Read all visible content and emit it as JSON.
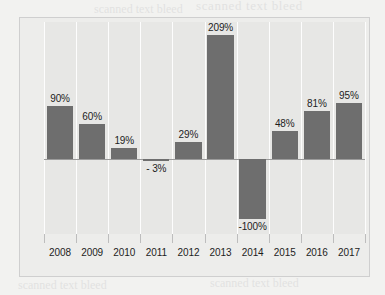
{
  "chart_data": {
    "type": "bar",
    "title": "",
    "xlabel": "",
    "ylabel": "Return on Investment",
    "categories": [
      "2008",
      "2009",
      "2010",
      "2011",
      "2012",
      "2013",
      "2014",
      "2015",
      "2016",
      "2017"
    ],
    "values": [
      90,
      60,
      19,
      -3,
      29,
      209,
      -100,
      48,
      81,
      95
    ],
    "data_labels": [
      "90%",
      "60%",
      "19%",
      "- 3%",
      "29%",
      "209%",
      "-100%",
      "48%",
      "81%",
      "95%"
    ],
    "unit": "%",
    "ylim": [
      -125,
      230
    ],
    "grid": "vertical-category-gridlines",
    "legend": "none",
    "bar_color": "#6e6e6e",
    "plot_background": "#e7e7e5",
    "gridline_color": "#fdfdfd",
    "zero_line_color": "#9b9b9b",
    "frame_color": "#cfcfcf"
  },
  "artifacts": {
    "bleed_1": "scanned text bleed",
    "bleed_2": "scanned text bleed",
    "bleed_3": "scanned text bleed",
    "bleed_4": "scanned text bleed",
    "bleed_5": "scanned text bleed",
    "bleed_6": "scanned text bleed"
  }
}
